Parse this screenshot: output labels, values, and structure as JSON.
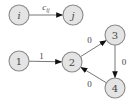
{
  "diagram": {
    "type": "directed-graph",
    "legend": {
      "from": "i",
      "to": "j",
      "edge_label": "c",
      "edge_label_subscript": "ij",
      "description": "edge from node i to node j with cost c_ij"
    },
    "nodes": [
      {
        "id": "i",
        "label": "i",
        "italic": true
      },
      {
        "id": "j",
        "label": "j",
        "italic": true
      },
      {
        "id": "1",
        "label": "1",
        "italic": false
      },
      {
        "id": "2",
        "label": "2",
        "italic": false
      },
      {
        "id": "3",
        "label": "3",
        "italic": false
      },
      {
        "id": "4",
        "label": "4",
        "italic": false
      }
    ],
    "edges": [
      {
        "from": "i",
        "to": "j",
        "label": "c",
        "subscript": "ij",
        "italic": true
      },
      {
        "from": "1",
        "to": "2",
        "label": "1"
      },
      {
        "from": "2",
        "to": "3",
        "label": "0"
      },
      {
        "from": "3",
        "to": "4",
        "label": "0"
      },
      {
        "from": "4",
        "to": "2",
        "label": "0"
      }
    ],
    "colors": {
      "node_fill": "#e4e4e4",
      "node_stroke": "#8a8a8a",
      "edge": "#666666",
      "arrowhead": "#111111",
      "text": "#444444"
    }
  }
}
